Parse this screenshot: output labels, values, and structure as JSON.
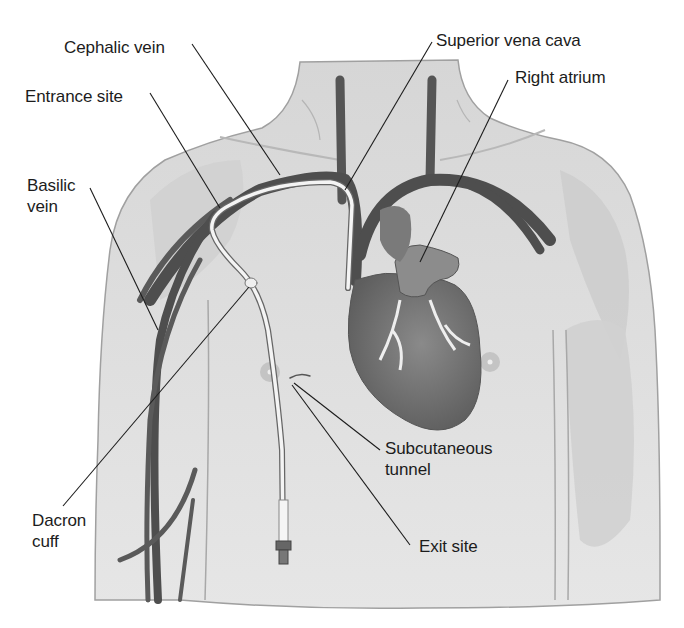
{
  "diagram": {
    "colors": {
      "skin": "#dcdcdc",
      "skin_shadow": "#c6c6c6",
      "outline": "#9a9a9a",
      "vein": "#5a5a5a",
      "vein_dark": "#3e3e3e",
      "heart": "#7a7a7a",
      "catheter": "#f4f4f4",
      "leader_line": "#1c1c1c",
      "text": "#1c1c1c"
    },
    "labels": {
      "cephalic_vein": "Cephalic vein",
      "entrance_site": "Entrance site",
      "basilic_vein_line1": "Basilic",
      "basilic_vein_line2": "vein",
      "superior_vena_cava": "Superior vena cava",
      "right_atrium": "Right atrium",
      "subcutaneous_tunnel_line1": "Subcutaneous",
      "subcutaneous_tunnel_line2": "tunnel",
      "dacron_cuff_line1": "Dacron",
      "dacron_cuff_line2": "cuff",
      "exit_site": "Exit site"
    }
  }
}
